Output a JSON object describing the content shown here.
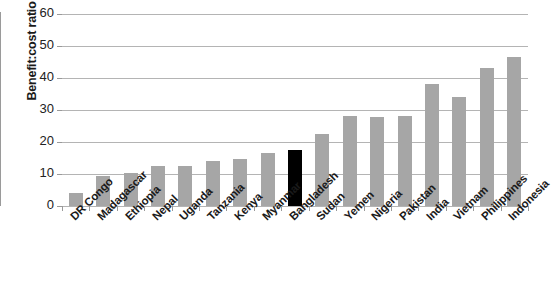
{
  "chart_data": {
    "type": "bar",
    "title": "",
    "xlabel": "",
    "ylabel": "Benefit:cost ratio",
    "ylim": [
      0,
      60
    ],
    "ytick_step": 10,
    "yticks": [
      "0",
      "10",
      "20",
      "30",
      "40",
      "50",
      "60"
    ],
    "grid": true,
    "legend": "none",
    "categories": [
      "DR Congo",
      "Madagascar",
      "Ethiopia",
      "Nepal",
      "Uganda",
      "Tanzania",
      "Kenya",
      "Myanmar",
      "Bangladesh",
      "Sudan",
      "Yemen",
      "Nigeria",
      "Pakistan",
      "India",
      "Vietnam",
      "Philippines",
      "Indonesia"
    ],
    "values": [
      4,
      9.5,
      10.3,
      12.5,
      12.4,
      14.2,
      14.6,
      16.6,
      17.4,
      22.5,
      28,
      27.9,
      28,
      38,
      34.2,
      43,
      46.5
    ],
    "highlight_index": 8,
    "colors": {
      "bar": "#a6a6a6",
      "bar_highlight": "#000000",
      "gridline": "#b4b4b4",
      "axis": "#9a9a9a",
      "text": "#1a1a1a",
      "background": "#ffffff"
    }
  }
}
